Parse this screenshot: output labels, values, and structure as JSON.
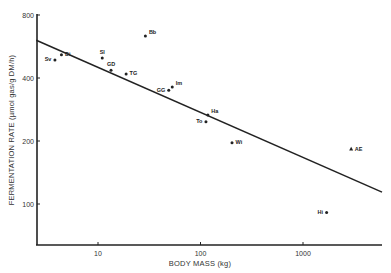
{
  "chart_data": {
    "type": "scatter",
    "title": "",
    "xlabel": "BODY MASS (kg)",
    "ylabel": "FERMENTATION RATE (µmol gas/g DM/h)",
    "xscale": "log",
    "yscale": "log",
    "xlim": [
      2.4,
      6000
    ],
    "ylim": [
      45,
      800
    ],
    "x_ticks": [
      10,
      100,
      1000
    ],
    "x_tick_labels": [
      "10",
      "100",
      "1000"
    ],
    "y_ticks": [
      100,
      200,
      400,
      800
    ],
    "y_tick_labels": [
      "100",
      "200",
      "400",
      "800"
    ],
    "grid": false,
    "legend": null,
    "points": [
      {
        "label": "Sv",
        "x": 3.8,
        "y": 488,
        "marker": "circle",
        "label_side": "left"
      },
      {
        "label": "Di",
        "x": 4.4,
        "y": 516,
        "marker": "circle",
        "label_side": "right"
      },
      {
        "label": "Sl",
        "x": 11,
        "y": 499,
        "marker": "circle",
        "label_side": "above"
      },
      {
        "label": "Bb",
        "x": 29,
        "y": 635,
        "marker": "circle",
        "label_side": "right"
      },
      {
        "label": "GD",
        "x": 13.4,
        "y": 436,
        "marker": "circle",
        "label_side": "above"
      },
      {
        "label": "TG",
        "x": 18.8,
        "y": 418,
        "marker": "circle",
        "label_side": "right"
      },
      {
        "label": "GG",
        "x": 49,
        "y": 350,
        "marker": "circle",
        "label_side": "left"
      },
      {
        "label": "Im",
        "x": 53,
        "y": 362,
        "marker": "circle",
        "label_side": "right"
      },
      {
        "label": "Ha",
        "x": 118,
        "y": 266,
        "marker": "circle",
        "label_side": "right"
      },
      {
        "label": "To",
        "x": 113,
        "y": 247,
        "marker": "circle",
        "label_side": "left"
      },
      {
        "label": "Wi",
        "x": 203,
        "y": 196,
        "marker": "circle",
        "label_side": "right"
      },
      {
        "label": "AE",
        "x": 2950,
        "y": 183,
        "marker": "triangle",
        "label_side": "right"
      },
      {
        "label": "Hi",
        "x": 1700,
        "y": 91,
        "marker": "circle",
        "label_side": "left"
      }
    ],
    "regression_line": {
      "x": [
        2.5,
        5900
      ],
      "y": [
        606,
        114
      ]
    }
  }
}
